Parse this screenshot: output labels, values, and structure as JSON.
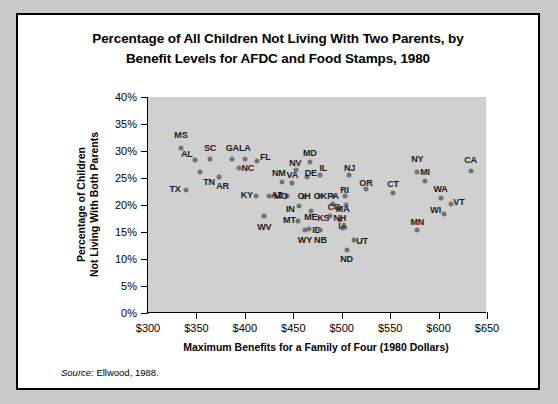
{
  "figure": {
    "title": "Percentage of All Children Not Living With Two Parents, by Benefit Levels for AFDC and Food Stamps, 1980",
    "title_line1": "Percentage of All Children Not Living With Two Parents, by",
    "title_line2": "Benefit Levels for AFDC and Food Stamps, 1980",
    "source_prefix": "Source:",
    "source_text": " Ellwood, 1988.",
    "plot_background": "#d0d0d0",
    "marker_color": "#737373"
  },
  "chart_data": {
    "type": "scatter",
    "title": "Percentage of All Children Not Living With Two Parents, by Benefit Levels for AFDC and Food Stamps, 1980",
    "xlabel": "Maximum Benefits for a Family of Four (1980 Dollars)",
    "ylabel": "Percentage of Children Not Living With Both Parents",
    "ylabel_line1": "Percentage of Children",
    "ylabel_line2": "Not Living With Both Parents",
    "xlim": [
      300,
      650
    ],
    "ylim": [
      0,
      40
    ],
    "xticks": [
      300,
      350,
      400,
      450,
      500,
      550,
      600,
      650
    ],
    "xtick_labels": [
      "$300",
      "$350",
      "$400",
      "$450",
      "$500",
      "$550",
      "$600",
      "$650"
    ],
    "yticks": [
      0,
      5,
      10,
      15,
      20,
      25,
      30,
      35,
      40
    ],
    "ytick_labels": [
      "0%",
      "5%",
      "10%",
      "15%",
      "20%",
      "25%",
      "30%",
      "35%",
      "40%"
    ],
    "grid": false,
    "legend": "none",
    "point_label_field": "state",
    "points": [
      {
        "state": "MS",
        "x": 334,
        "y": 30.6,
        "lx": 334,
        "ly": 33.0
      },
      {
        "state": "AL",
        "x": 349,
        "y": 28.4,
        "lx": 340,
        "ly": 29.5
      },
      {
        "state": "SC",
        "x": 364,
        "y": 28.5,
        "lx": 364,
        "ly": 30.6
      },
      {
        "state": "GA",
        "x": 387,
        "y": 28.5,
        "lx": 387,
        "ly": 30.6
      },
      {
        "state": "LA",
        "x": 400,
        "y": 28.5,
        "lx": 400,
        "ly": 30.6
      },
      {
        "state": "FL",
        "x": 413,
        "y": 28.2,
        "lx": 421,
        "ly": 28.8
      },
      {
        "state": "NC",
        "x": 394,
        "y": 26.8,
        "lx": 403,
        "ly": 26.9
      },
      {
        "state": "TN",
        "x": 354,
        "y": 26.2,
        "lx": 363,
        "ly": 24.3
      },
      {
        "state": "AR",
        "x": 373,
        "y": 25.1,
        "lx": 377,
        "ly": 23.6
      },
      {
        "state": "TX",
        "x": 339,
        "y": 22.8,
        "lx": 328,
        "ly": 22.9
      },
      {
        "state": "KY",
        "x": 411,
        "y": 21.6,
        "lx": 402,
        "ly": 21.8
      },
      {
        "state": "AZ",
        "x": 425,
        "y": 21.7,
        "lx": 433,
        "ly": 21.8
      },
      {
        "state": "WV",
        "x": 420,
        "y": 17.9,
        "lx": 420,
        "ly": 15.9
      },
      {
        "state": "NM",
        "x": 438,
        "y": 24.2,
        "lx": 435,
        "ly": 26.0
      },
      {
        "state": "VA",
        "x": 449,
        "y": 24.0,
        "lx": 449,
        "ly": 25.6
      },
      {
        "state": "MO",
        "x": 444,
        "y": 21.6,
        "lx": 437,
        "ly": 21.7
      },
      {
        "state": "NV",
        "x": 453,
        "y": 26.4,
        "lx": 452,
        "ly": 27.8
      },
      {
        "state": "MD",
        "x": 467,
        "y": 28.0,
        "lx": 467,
        "ly": 29.6
      },
      {
        "state": "DE",
        "x": 464,
        "y": 25.2,
        "lx": 468,
        "ly": 25.9
      },
      {
        "state": "IL",
        "x": 478,
        "y": 25.6,
        "lx": 481,
        "ly": 26.9
      },
      {
        "state": "OH",
        "x": 461,
        "y": 21.5,
        "lx": 461,
        "ly": 21.6
      },
      {
        "state": "IN",
        "x": 456,
        "y": 19.9,
        "lx": 447,
        "ly": 19.3
      },
      {
        "state": "ME",
        "x": 468,
        "y": 18.9,
        "lx": 468,
        "ly": 17.8
      },
      {
        "state": "MT",
        "x": 455,
        "y": 17.1,
        "lx": 446,
        "ly": 17.2
      },
      {
        "state": "ID",
        "x": 466,
        "y": 15.6,
        "lx": 474,
        "ly": 15.3
      },
      {
        "state": "WY",
        "x": 462,
        "y": 15.3,
        "lx": 462,
        "ly": 13.6
      },
      {
        "state": "NB",
        "x": 478,
        "y": 15.3,
        "lx": 478,
        "ly": 13.6
      },
      {
        "state": "OK",
        "x": 478,
        "y": 21.6,
        "lx": 478,
        "ly": 21.6
      },
      {
        "state": "PA",
        "x": 491,
        "y": 21.6,
        "lx": 491,
        "ly": 21.6
      },
      {
        "state": "CO",
        "x": 491,
        "y": 20.2,
        "lx": 492,
        "ly": 19.6
      },
      {
        "state": "KS",
        "x": 488,
        "y": 18.0,
        "lx": 481,
        "ly": 17.6
      },
      {
        "state": "RI",
        "x": 503,
        "y": 21.7,
        "lx": 503,
        "ly": 22.7
      },
      {
        "state": "NJ",
        "x": 508,
        "y": 25.5,
        "lx": 508,
        "ly": 26.9
      },
      {
        "state": "MA",
        "x": 504,
        "y": 20.0,
        "lx": 501,
        "ly": 19.2
      },
      {
        "state": "NH",
        "x": 498,
        "y": 17.2,
        "lx": 498,
        "ly": 17.6
      },
      {
        "state": "IA",
        "x": 501,
        "y": 15.8,
        "lx": 501,
        "ly": 16.1
      },
      {
        "state": "UT",
        "x": 513,
        "y": 13.5,
        "lx": 521,
        "ly": 13.4
      },
      {
        "state": "ND",
        "x": 505,
        "y": 11.6,
        "lx": 505,
        "ly": 10.0
      },
      {
        "state": "OR",
        "x": 525,
        "y": 23.0,
        "lx": 525,
        "ly": 24.0
      },
      {
        "state": "CT",
        "x": 553,
        "y": 22.3,
        "lx": 553,
        "ly": 23.9
      },
      {
        "state": "MN",
        "x": 578,
        "y": 15.4,
        "lx": 578,
        "ly": 16.9
      },
      {
        "state": "NY",
        "x": 578,
        "y": 26.1,
        "lx": 578,
        "ly": 28.6
      },
      {
        "state": "MI",
        "x": 586,
        "y": 24.5,
        "lx": 586,
        "ly": 26.2
      },
      {
        "state": "WA",
        "x": 602,
        "y": 21.3,
        "lx": 602,
        "ly": 23.0
      },
      {
        "state": "VT",
        "x": 613,
        "y": 20.2,
        "lx": 621,
        "ly": 20.5
      },
      {
        "state": "WI",
        "x": 606,
        "y": 18.4,
        "lx": 597,
        "ly": 19.0
      },
      {
        "state": "CA",
        "x": 633,
        "y": 26.3,
        "lx": 633,
        "ly": 28.4
      }
    ]
  }
}
